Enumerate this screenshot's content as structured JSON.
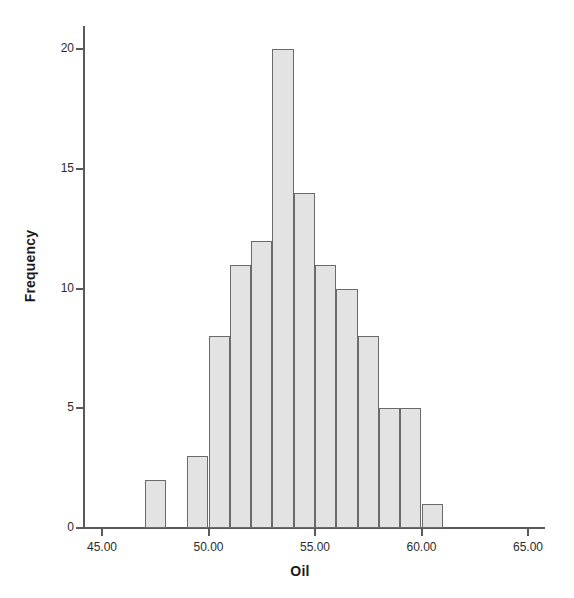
{
  "chart_data": {
    "type": "bar",
    "title": "",
    "subtitle": "",
    "xlabel": "Oil",
    "ylabel": "Frequency",
    "xlim": [
      43.6,
      65.8
    ],
    "ylim": [
      0,
      21
    ],
    "grid": false,
    "legend": null,
    "bin_width": 1.0,
    "bin_starts": [
      47,
      48,
      49,
      50,
      51,
      52,
      53,
      54,
      55,
      56,
      57,
      58,
      59,
      60
    ],
    "categories": [
      "47-48",
      "48-49",
      "49-50",
      "50-51",
      "51-52",
      "52-53",
      "53-54",
      "54-55",
      "55-56",
      "56-57",
      "57-58",
      "58-59",
      "59-60",
      "60-61"
    ],
    "values": [
      2,
      0,
      3,
      8,
      11,
      12,
      20,
      14,
      11,
      10,
      8,
      5,
      5,
      1
    ],
    "x_ticks": [
      45.0,
      50.0,
      55.0,
      60.0,
      65.0
    ],
    "x_tick_labels": [
      "45.00",
      "50.00",
      "55.00",
      "60.00",
      "65.00"
    ],
    "y_ticks": [
      0,
      5,
      10,
      15,
      20
    ],
    "y_tick_labels": [
      "0",
      "5",
      "10",
      "15",
      "20"
    ],
    "bar_fill_color": "#e3e3e3",
    "bar_edge_color": "#6b6b6b",
    "axis_color": "#5a5a5a",
    "background_color": "#ffffff",
    "total_count": 110
  }
}
